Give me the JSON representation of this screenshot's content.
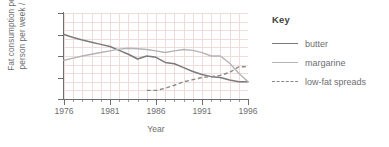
{
  "chart_data": {
    "type": "line",
    "title": "",
    "xlabel": "Year",
    "ylabel": "Fat consumption per person per week / g",
    "xlim": [
      1976,
      1996
    ],
    "ylim": [
      0,
      200
    ],
    "yticks": [
      0,
      50,
      100,
      150,
      200
    ],
    "xticks": [
      1976,
      1981,
      1986,
      1991,
      1996
    ],
    "grid": true,
    "legend_position": "right",
    "legend_title": "Key",
    "x": [
      1976,
      1977,
      1978,
      1979,
      1980,
      1981,
      1982,
      1983,
      1984,
      1985,
      1986,
      1987,
      1988,
      1989,
      1990,
      1991,
      1992,
      1993,
      1994,
      1995,
      1996
    ],
    "series": [
      {
        "name": "butter",
        "style": "solid",
        "color": "#7b7b7b",
        "values": [
          150,
          143,
          137,
          132,
          127,
          122,
          113,
          104,
          93,
          100,
          97,
          85,
          82,
          73,
          64,
          57,
          52,
          50,
          44,
          40,
          40
        ]
      },
      {
        "name": "margarine",
        "style": "solid",
        "color": "#b4b4b4",
        "values": [
          90,
          95,
          100,
          104,
          108,
          112,
          116,
          118,
          117,
          115,
          112,
          108,
          112,
          115,
          113,
          108,
          100,
          100,
          83,
          60,
          40
        ]
      },
      {
        "name": "low-fat spreads",
        "style": "dashed",
        "color": "#8a8a8a",
        "values": [
          null,
          null,
          null,
          null,
          null,
          null,
          null,
          null,
          null,
          20,
          20,
          25,
          32,
          40,
          45,
          50,
          52,
          55,
          62,
          75,
          75
        ]
      }
    ]
  },
  "axes": {
    "ylabel_line1": "Fat consumption per",
    "ylabel_line2": "person per week / g",
    "xlabel": "Year",
    "ytick_labels": [
      "200",
      "150",
      "100",
      "50",
      "0"
    ],
    "xtick_labels": [
      "1976",
      "1981",
      "1986",
      "1991",
      "1996"
    ]
  },
  "legend": {
    "title": "Key",
    "items": [
      {
        "label": "butter"
      },
      {
        "label": "margarine"
      },
      {
        "label": "low-fat spreads"
      }
    ]
  }
}
